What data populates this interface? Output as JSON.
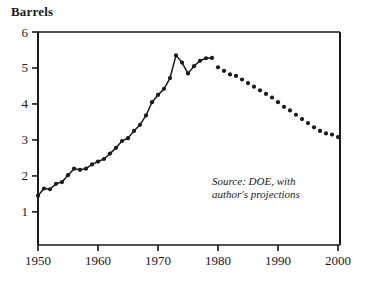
{
  "chart_data": {
    "type": "line",
    "title": "Barrels",
    "xlabel": "",
    "ylabel": "Barrels",
    "xlim": [
      1950,
      2000
    ],
    "ylim": [
      0.08,
      6
    ],
    "grid": false,
    "legend": null,
    "xticks": [
      1950,
      1960,
      1970,
      1980,
      1990,
      2000
    ],
    "yticks": [
      1,
      2,
      3,
      4,
      5,
      6
    ],
    "annotations": [
      "Source: DOE, with",
      "author's projections"
    ],
    "series": [
      {
        "name": "Historical (DOE)",
        "style": "line-with-markers",
        "x": [
          1950,
          1951,
          1952,
          1953,
          1954,
          1955,
          1956,
          1957,
          1958,
          1959,
          1960,
          1961,
          1962,
          1963,
          1964,
          1965,
          1966,
          1967,
          1968,
          1969,
          1970,
          1971,
          1972,
          1973,
          1974,
          1975,
          1976,
          1977,
          1978,
          1979
        ],
        "values": [
          1.45,
          1.65,
          1.63,
          1.78,
          1.83,
          2.02,
          2.2,
          2.17,
          2.2,
          2.32,
          2.4,
          2.47,
          2.62,
          2.78,
          2.97,
          3.05,
          3.25,
          3.42,
          3.68,
          4.05,
          4.25,
          4.42,
          4.72,
          5.35,
          5.15,
          4.85,
          5.05,
          5.2,
          5.27,
          5.28
        ]
      },
      {
        "name": "Author's projections",
        "style": "dotted-markers",
        "x": [
          1980,
          1981,
          1982,
          1983,
          1984,
          1985,
          1986,
          1987,
          1988,
          1989,
          1990,
          1991,
          1992,
          1993,
          1994,
          1995,
          1996,
          1997,
          1998,
          1999,
          2000
        ],
        "values": [
          5.02,
          4.92,
          4.82,
          4.78,
          4.68,
          4.58,
          4.48,
          4.38,
          4.28,
          4.18,
          4.05,
          3.92,
          3.82,
          3.7,
          3.58,
          3.47,
          3.35,
          3.25,
          3.18,
          3.15,
          3.08
        ]
      }
    ]
  },
  "style": {
    "axis_color": "#1a1a1a",
    "marker_color": "#1a1a1a",
    "line_color": "#1a1a1a",
    "background": "#ffffff"
  }
}
